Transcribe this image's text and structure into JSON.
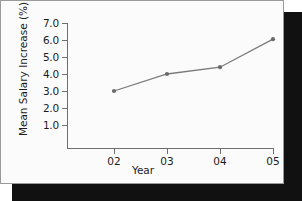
{
  "chart_data": {
    "type": "line",
    "title": "",
    "xlabel": "Year",
    "ylabel": "Mean Salary Increase (%)",
    "categories": [
      "02",
      "03",
      "04",
      "05"
    ],
    "values": [
      3.0,
      4.0,
      4.4,
      6.05
    ],
    "series": [
      {
        "name": "Mean Salary Increase",
        "values": [
          3.0,
          4.0,
          4.4,
          6.05
        ]
      }
    ],
    "ytick_labels": [
      "7.0",
      "6.0",
      "5.0",
      "4.0",
      "3.0",
      "2.0",
      "1.0"
    ],
    "ytick_values": [
      7.0,
      6.0,
      5.0,
      4.0,
      3.0,
      2.0,
      1.0
    ],
    "xtick_labels": [
      "02",
      "03",
      "04",
      "05"
    ],
    "ylim": [
      0.0,
      7.0
    ],
    "grid": false,
    "legend": false,
    "line_color": "#7a7a7a",
    "marker_color": "#6b6b6b",
    "axis_color": "#6f6f6f",
    "text_color": "#1b1b1b",
    "background_color": "#fbfbfb"
  },
  "figure": {
    "frame_border_color": "#9a9a9a",
    "shadow_color": "#111111"
  }
}
